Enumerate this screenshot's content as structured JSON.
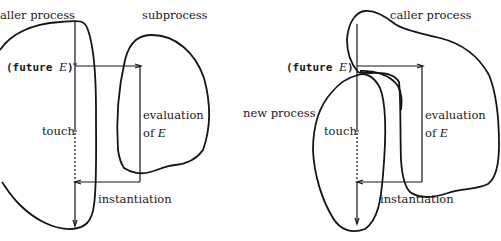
{
  "left_diagram": {
    "caller_label": "aller process",
    "subprocess_label": "subprocess",
    "future_call": {
      "prefix": "(future ",
      "var": "E",
      "suffix": ")"
    },
    "touch_label": "touch",
    "evaluation_label": "evaluation",
    "of_label": "of ",
    "of_var": "E",
    "instantiation_label": "instantiation"
  },
  "right_diagram": {
    "caller_label": "caller process",
    "new_process_label": "new process",
    "future_call": {
      "prefix": "(future ",
      "var": "E",
      "suffix": ")"
    },
    "touch_label": "touch",
    "evaluation_label": "evaluation",
    "of_label": "of ",
    "of_var": "E",
    "instantiation_label": "instantiation"
  },
  "colors": {
    "ink": "#151515",
    "background": "#ffffff"
  }
}
